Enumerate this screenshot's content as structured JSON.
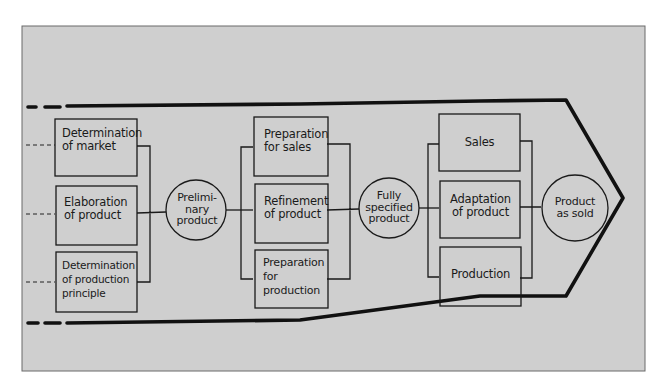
{
  "diagram": {
    "type": "product development process flow",
    "colors": {
      "panel": "#cfcfcf",
      "ink": "#111111",
      "background": "#ffffff"
    },
    "stages": [
      {
        "id": "stage-1",
        "boxes": [
          {
            "label": "Determination\nof market",
            "line1": "Determination",
            "line2": "of market",
            "line3": ""
          },
          {
            "label": "Elaboration\nof product",
            "line1": "Elaboration",
            "line2": "of product",
            "line3": ""
          },
          {
            "label": "Determination\nof production\nprinciple",
            "line1": "Determination",
            "line2": "of production",
            "line3": "principle"
          }
        ],
        "output": {
          "line1": "Prelimi-",
          "line2": "nary",
          "line3": "product"
        }
      },
      {
        "id": "stage-2",
        "boxes": [
          {
            "label": "Preparation\nfor sales",
            "line1": "Preparation",
            "line2": "for sales",
            "line3": ""
          },
          {
            "label": "Refinement\nof product",
            "line1": "Refinement",
            "line2": "of product",
            "line3": ""
          },
          {
            "label": "Preparation\nfor\nproduction",
            "line1": "Preparation",
            "line2": "for",
            "line3": "production"
          }
        ],
        "output": {
          "line1": "Fully",
          "line2": "specified",
          "line3": "product"
        }
      },
      {
        "id": "stage-3",
        "boxes": [
          {
            "label": "Sales",
            "line1": "Sales",
            "line2": "",
            "line3": ""
          },
          {
            "label": "Adaptation\nof product",
            "line1": "Adaptation",
            "line2": "of product",
            "line3": ""
          },
          {
            "label": "Production",
            "line1": "Production",
            "line2": "",
            "line3": ""
          }
        ],
        "output": {
          "line1": "Product",
          "line2": "as sold",
          "line3": ""
        }
      }
    ],
    "flow_shape": "arrow-pointing-right",
    "left_edge_style": "dashed"
  }
}
